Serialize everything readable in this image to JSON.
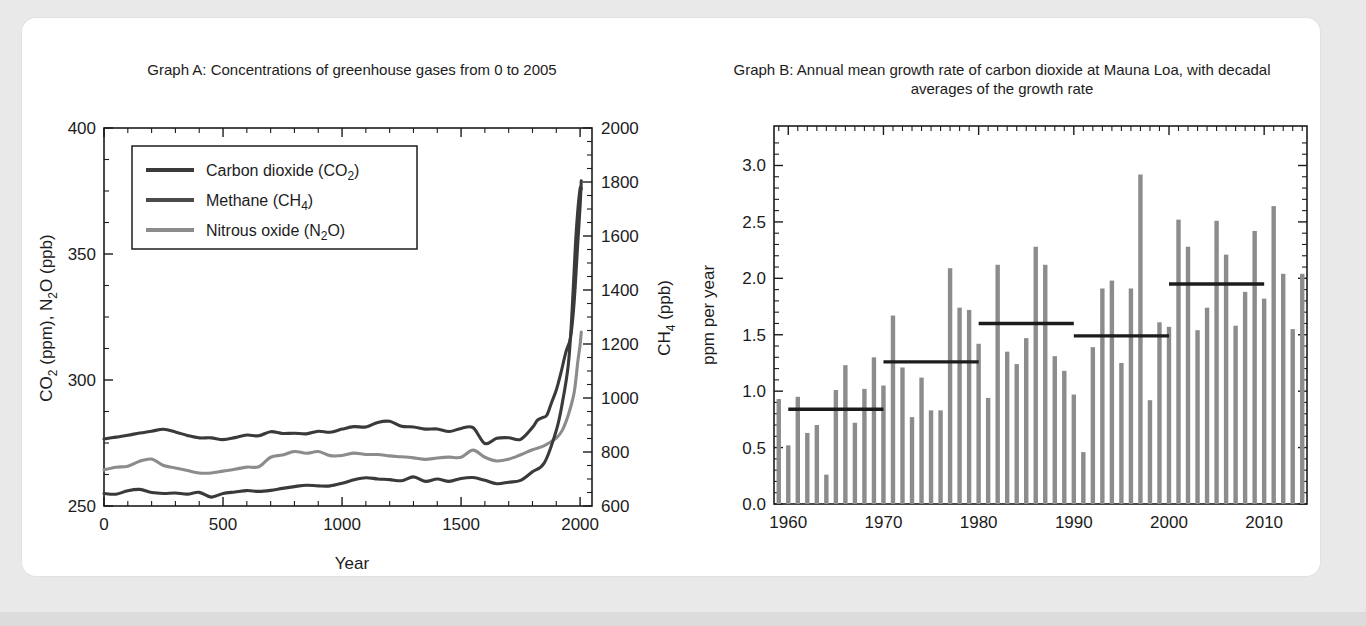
{
  "page": {
    "background_color": "#e9e9e9",
    "card_color": "#ffffff"
  },
  "chart_data": [
    {
      "id": "graph-a",
      "type": "line",
      "title": "Graph A: Concentrations of greenhouse gases from 0 to 2005",
      "xlabel": "Year",
      "ylabel_left": "CO2 (ppm), N2O (ppb)",
      "ylabel_right": "CH4 (ppb)",
      "xlim": [
        0,
        2050
      ],
      "ylim_left": [
        250,
        400
      ],
      "ylim_right": [
        600,
        2000
      ],
      "xticks": [
        0,
        500,
        1000,
        1500,
        2000
      ],
      "yticks_left": [
        250,
        300,
        350,
        400
      ],
      "yticks_right": [
        600,
        800,
        1000,
        1200,
        1400,
        1600,
        1800,
        2000
      ],
      "grid": false,
      "legend_position": "upper-left",
      "series": [
        {
          "name": "Carbon dioxide (CO2)",
          "legend_label": "Carbon dioxide (CO₂)",
          "color": "#3a3a3a",
          "axis": "left",
          "units": "ppm",
          "x": [
            0,
            50,
            100,
            150,
            200,
            250,
            300,
            350,
            400,
            450,
            500,
            550,
            600,
            650,
            700,
            750,
            800,
            850,
            900,
            950,
            1000,
            1050,
            1100,
            1150,
            1200,
            1250,
            1300,
            1350,
            1400,
            1450,
            1500,
            1550,
            1600,
            1650,
            1700,
            1750,
            1800,
            1820,
            1840,
            1860,
            1880,
            1900,
            1920,
            1940,
            1960,
            1975,
            1990,
            2000,
            2005
          ],
          "y": [
            277,
            277,
            278,
            279,
            280,
            280,
            279,
            278,
            277,
            277,
            277,
            277,
            278,
            278,
            279,
            279,
            279,
            279,
            279,
            279,
            280,
            281,
            282,
            283,
            283,
            282,
            281,
            281,
            280,
            280,
            281,
            281,
            275,
            277,
            277,
            277,
            281,
            284,
            285,
            286,
            291,
            296,
            303,
            311,
            317,
            331,
            354,
            369,
            379
          ]
        },
        {
          "name": "Nitrous oxide (N2O)",
          "legend_label": "Nitrous oxide (N₂O)",
          "color": "#8c8c8c",
          "axis": "left",
          "units": "ppb",
          "x": [
            0,
            50,
            100,
            150,
            200,
            250,
            300,
            350,
            400,
            450,
            500,
            550,
            600,
            650,
            700,
            750,
            800,
            850,
            900,
            950,
            1000,
            1050,
            1100,
            1150,
            1200,
            1250,
            1300,
            1350,
            1400,
            1450,
            1500,
            1550,
            1600,
            1650,
            1700,
            1750,
            1800,
            1850,
            1900,
            1925,
            1950,
            1975,
            1990,
            2000,
            2005
          ],
          "y": [
            265,
            266,
            266,
            268,
            268,
            266,
            265,
            264,
            263,
            263,
            264,
            264,
            265,
            266,
            269,
            270,
            271,
            271,
            271,
            270,
            270,
            271,
            271,
            271,
            270,
            269,
            269,
            269,
            269,
            269,
            270,
            272,
            270,
            268,
            269,
            270,
            272,
            274,
            277,
            280,
            286,
            295,
            307,
            314,
            319
          ]
        },
        {
          "name": "Methane (CH4)",
          "legend_label": "Methane (CH₄)",
          "color": "#3a3a3a",
          "axis": "right",
          "units": "ppb",
          "x": [
            0,
            50,
            100,
            150,
            200,
            250,
            300,
            350,
            400,
            450,
            500,
            550,
            600,
            650,
            700,
            750,
            800,
            850,
            900,
            950,
            1000,
            1050,
            1100,
            1150,
            1200,
            1250,
            1300,
            1350,
            1400,
            1450,
            1500,
            1550,
            1600,
            1650,
            1700,
            1750,
            1800,
            1850,
            1900,
            1925,
            1950,
            1965,
            1980,
            1990,
            2000,
            2005
          ],
          "y": [
            650,
            645,
            660,
            655,
            648,
            640,
            645,
            650,
            645,
            640,
            650,
            648,
            655,
            660,
            665,
            670,
            672,
            678,
            680,
            682,
            690,
            695,
            700,
            705,
            703,
            700,
            700,
            698,
            695,
            693,
            698,
            700,
            695,
            688,
            690,
            692,
            720,
            760,
            880,
            980,
            1120,
            1300,
            1560,
            1690,
            1775,
            1774
          ]
        }
      ]
    },
    {
      "id": "graph-b",
      "type": "bar",
      "title": "Graph B: Annual mean growth rate of carbon dioxide at Mauna Loa, with decadal averages of the growth rate",
      "xlabel": "",
      "ylabel": "ppm per year",
      "xlim": [
        1958.5,
        2014.5
      ],
      "ylim": [
        0.0,
        3.35
      ],
      "xticks": [
        1960,
        1970,
        1980,
        1990,
        2000,
        2010
      ],
      "yticks": [
        0.0,
        0.5,
        1.0,
        1.5,
        2.0,
        2.5,
        3.0
      ],
      "grid": false,
      "bar_color": "#8c8c8c",
      "categories": [
        1959,
        1960,
        1961,
        1962,
        1963,
        1964,
        1965,
        1966,
        1967,
        1968,
        1969,
        1970,
        1971,
        1972,
        1973,
        1974,
        1975,
        1976,
        1977,
        1978,
        1979,
        1980,
        1981,
        1982,
        1983,
        1984,
        1985,
        1986,
        1987,
        1988,
        1989,
        1990,
        1991,
        1992,
        1993,
        1994,
        1995,
        1996,
        1997,
        1998,
        1999,
        2000,
        2001,
        2002,
        2003,
        2004,
        2005,
        2006,
        2007,
        2008,
        2009,
        2010,
        2011,
        2012,
        2013,
        2014
      ],
      "values": [
        0.93,
        0.52,
        0.95,
        0.63,
        0.7,
        0.26,
        1.01,
        1.23,
        0.72,
        1.02,
        1.3,
        1.05,
        1.67,
        1.21,
        0.77,
        1.12,
        0.83,
        0.83,
        2.09,
        1.74,
        1.72,
        1.42,
        0.94,
        2.12,
        1.35,
        1.24,
        1.47,
        2.28,
        2.12,
        1.31,
        1.18,
        0.97,
        0.46,
        1.39,
        1.91,
        1.98,
        1.25,
        1.91,
        2.92,
        0.92,
        1.61,
        1.57,
        2.52,
        2.28,
        1.54,
        1.74,
        2.51,
        2.21,
        1.58,
        1.88,
        2.42,
        1.82,
        2.64,
        2.04,
        1.55,
        2.04
      ],
      "decadal_averages": [
        {
          "label": "1960s",
          "start_year": 1960,
          "end_year": 1970,
          "value": 0.84
        },
        {
          "label": "1970s",
          "start_year": 1970,
          "end_year": 1980,
          "value": 1.26
        },
        {
          "label": "1980s",
          "start_year": 1980,
          "end_year": 1990,
          "value": 1.6
        },
        {
          "label": "1990s",
          "start_year": 1990,
          "end_year": 2000,
          "value": 1.49
        },
        {
          "label": "2000s",
          "start_year": 2000,
          "end_year": 2010,
          "value": 1.95
        }
      ],
      "decadal_line_color": "#1c1c1c"
    }
  ]
}
